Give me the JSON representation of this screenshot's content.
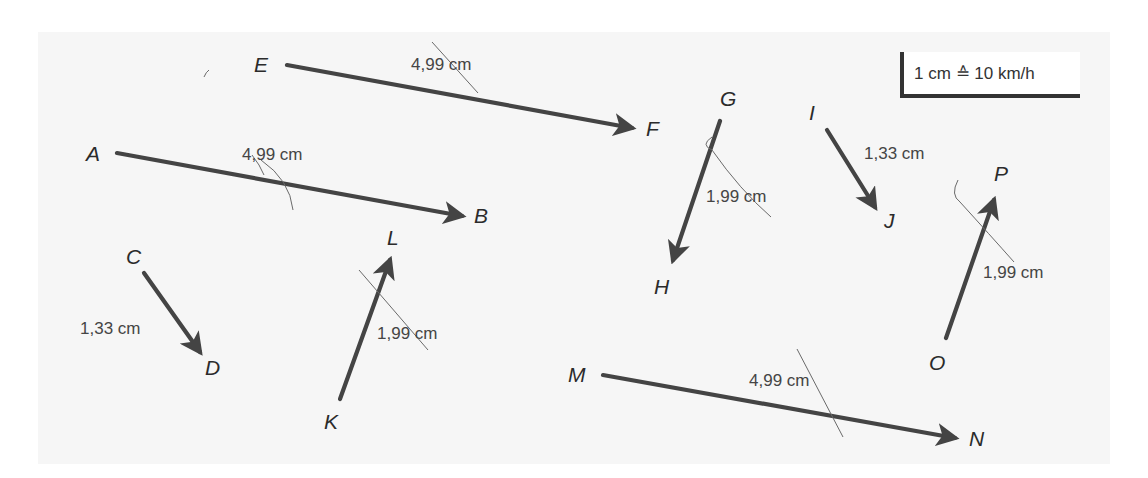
{
  "scale": {
    "label": "1 cm ≙ 10 km/h"
  },
  "colors": {
    "arrow": "#444444",
    "text": "#2b2b2b",
    "background": "#f6f6f6"
  },
  "vectors": [
    {
      "from": "A",
      "to": "B",
      "length_label": "4,99 cm"
    },
    {
      "from": "E",
      "to": "F",
      "length_label": "4,99 cm"
    },
    {
      "from": "C",
      "to": "D",
      "length_label": "1,33 cm"
    },
    {
      "from": "K",
      "to": "L",
      "length_label": "1,99 cm"
    },
    {
      "from": "G",
      "to": "H",
      "length_label": "1,99 cm"
    },
    {
      "from": "I",
      "to": "J",
      "length_label": "1,33 cm"
    },
    {
      "from": "O",
      "to": "P",
      "length_label": "1,99 cm"
    },
    {
      "from": "M",
      "to": "N",
      "length_label": "4,99 cm"
    }
  ],
  "points": {
    "A": "A",
    "B": "B",
    "C": "C",
    "D": "D",
    "E": "E",
    "F": "F",
    "G": "G",
    "H": "H",
    "I": "I",
    "J": "J",
    "K": "K",
    "L": "L",
    "M": "M",
    "N": "N",
    "O": "O",
    "P": "P"
  }
}
